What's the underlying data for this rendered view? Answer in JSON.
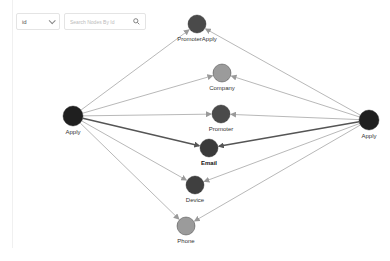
{
  "toolbar": {
    "field_select": {
      "value": "id"
    },
    "search": {
      "placeholder": "Search Nodes By Id",
      "value": ""
    }
  },
  "graph": {
    "nodes": [
      {
        "id": "apply-left",
        "label": "Apply",
        "x": 73,
        "y": 116,
        "r": 10,
        "color": "#1f1f1f"
      },
      {
        "id": "apply-right",
        "label": "Apply",
        "x": 369,
        "y": 120,
        "r": 10,
        "color": "#1f1f1f"
      },
      {
        "id": "promoterapply",
        "label": "PromoterApply",
        "x": 197,
        "y": 24,
        "r": 9,
        "color": "#4a4a4a"
      },
      {
        "id": "company",
        "label": "Company",
        "x": 222,
        "y": 73,
        "r": 9,
        "color": "#9b9b9b"
      },
      {
        "id": "promoter",
        "label": "Promoter",
        "x": 221,
        "y": 114,
        "r": 9,
        "color": "#4a4a4a"
      },
      {
        "id": "email",
        "label": "Email",
        "x": 209,
        "y": 148,
        "r": 9,
        "color": "#3a3a3a",
        "bold": true
      },
      {
        "id": "device",
        "label": "Device",
        "x": 195,
        "y": 185,
        "r": 9,
        "color": "#3f3f3f"
      },
      {
        "id": "phone",
        "label": "Phone",
        "x": 186,
        "y": 226,
        "r": 9,
        "color": "#9b9b9b"
      }
    ],
    "edges": [
      {
        "from": "apply-left",
        "to": "promoterapply",
        "highlight": false
      },
      {
        "from": "apply-left",
        "to": "company",
        "highlight": false
      },
      {
        "from": "apply-left",
        "to": "promoter",
        "highlight": false
      },
      {
        "from": "apply-left",
        "to": "email",
        "highlight": true
      },
      {
        "from": "apply-left",
        "to": "device",
        "highlight": false
      },
      {
        "from": "apply-left",
        "to": "phone",
        "highlight": false
      },
      {
        "from": "apply-right",
        "to": "promoterapply",
        "highlight": false
      },
      {
        "from": "apply-right",
        "to": "company",
        "highlight": false
      },
      {
        "from": "apply-right",
        "to": "promoter",
        "highlight": false
      },
      {
        "from": "apply-right",
        "to": "email",
        "highlight": true
      },
      {
        "from": "apply-right",
        "to": "device",
        "highlight": false
      },
      {
        "from": "apply-right",
        "to": "phone",
        "highlight": false
      }
    ],
    "colors": {
      "edge": "#9a9a9a",
      "edge_highlight": "#555555"
    }
  }
}
